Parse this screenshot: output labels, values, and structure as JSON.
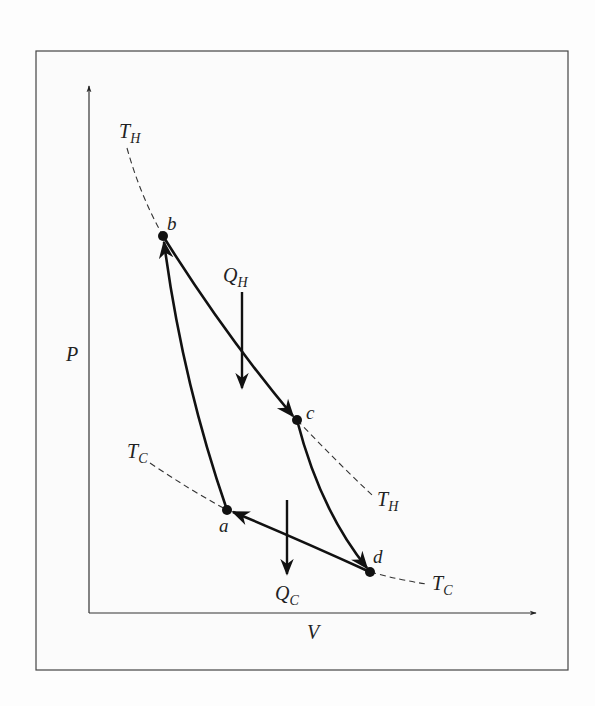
{
  "diagram": {
    "type": "P-V diagram (Carnot cycle)",
    "axes": {
      "y_label": "P",
      "x_label": "V"
    },
    "points": [
      {
        "id": "a",
        "label": "a"
      },
      {
        "id": "b",
        "label": "b"
      },
      {
        "id": "c",
        "label": "c"
      },
      {
        "id": "d",
        "label": "d"
      }
    ],
    "isotherms": {
      "hot": {
        "label_main": "T",
        "label_sub": "H"
      },
      "cold": {
        "label_main": "T",
        "label_sub": "C"
      }
    },
    "heat": {
      "in": {
        "label_main": "Q",
        "label_sub": "H"
      },
      "out": {
        "label_main": "Q",
        "label_sub": "C"
      }
    },
    "processes": [
      {
        "from": "a",
        "to": "b",
        "kind": "adiabatic compression"
      },
      {
        "from": "b",
        "to": "c",
        "kind": "isothermal expansion at T_H"
      },
      {
        "from": "c",
        "to": "d",
        "kind": "adiabatic expansion"
      },
      {
        "from": "d",
        "to": "a",
        "kind": "isothermal compression at T_C"
      }
    ]
  }
}
